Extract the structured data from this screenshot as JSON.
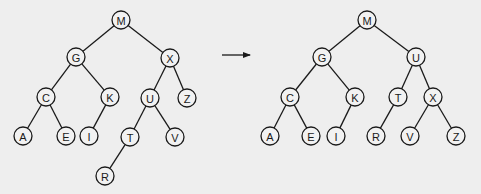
{
  "diagram": {
    "background": "#eeeeee",
    "stroke_color": "#1a1a1a",
    "node_radius": 9,
    "arrow": {
      "icon": "right-arrow-icon",
      "glyph": "→",
      "x1": 222,
      "y1": 55,
      "x2": 250,
      "y2": 55
    },
    "trees": [
      {
        "name": "before",
        "nodes": [
          {
            "id": "M",
            "label": "M",
            "x": 121,
            "y": 20
          },
          {
            "id": "G",
            "label": "G",
            "x": 76,
            "y": 57
          },
          {
            "id": "X",
            "label": "X",
            "x": 170,
            "y": 58
          },
          {
            "id": "C",
            "label": "C",
            "x": 46,
            "y": 97
          },
          {
            "id": "K",
            "label": "K",
            "x": 110,
            "y": 97
          },
          {
            "id": "U",
            "label": "U",
            "x": 150,
            "y": 98
          },
          {
            "id": "Z",
            "label": "Z",
            "x": 187,
            "y": 98
          },
          {
            "id": "A",
            "label": "A",
            "x": 23,
            "y": 136
          },
          {
            "id": "E",
            "label": "E",
            "x": 66,
            "y": 136
          },
          {
            "id": "I",
            "label": "I",
            "x": 89,
            "y": 136
          },
          {
            "id": "T",
            "label": "T",
            "x": 130,
            "y": 137
          },
          {
            "id": "V",
            "label": "V",
            "x": 175,
            "y": 137
          },
          {
            "id": "R",
            "label": "R",
            "x": 105,
            "y": 176
          }
        ],
        "edges": [
          [
            "M",
            "G"
          ],
          [
            "M",
            "X"
          ],
          [
            "G",
            "C"
          ],
          [
            "G",
            "K"
          ],
          [
            "X",
            "U"
          ],
          [
            "X",
            "Z"
          ],
          [
            "C",
            "A"
          ],
          [
            "C",
            "E"
          ],
          [
            "K",
            "I"
          ],
          [
            "U",
            "T"
          ],
          [
            "U",
            "V"
          ],
          [
            "T",
            "R"
          ]
        ]
      },
      {
        "name": "after",
        "nodes": [
          {
            "id": "M",
            "label": "M",
            "x": 367,
            "y": 20
          },
          {
            "id": "G",
            "label": "G",
            "x": 322,
            "y": 57
          },
          {
            "id": "U",
            "label": "U",
            "x": 416,
            "y": 57
          },
          {
            "id": "C",
            "label": "C",
            "x": 290,
            "y": 97
          },
          {
            "id": "K",
            "label": "K",
            "x": 355,
            "y": 97
          },
          {
            "id": "T",
            "label": "T",
            "x": 398,
            "y": 97
          },
          {
            "id": "X",
            "label": "X",
            "x": 433,
            "y": 97
          },
          {
            "id": "A",
            "label": "A",
            "x": 270,
            "y": 136
          },
          {
            "id": "E",
            "label": "E",
            "x": 311,
            "y": 136
          },
          {
            "id": "I",
            "label": "I",
            "x": 336,
            "y": 136
          },
          {
            "id": "R",
            "label": "R",
            "x": 376,
            "y": 136
          },
          {
            "id": "V",
            "label": "V",
            "x": 410,
            "y": 136
          },
          {
            "id": "Z",
            "label": "Z",
            "x": 456,
            "y": 136
          }
        ],
        "edges": [
          [
            "M",
            "G"
          ],
          [
            "M",
            "U"
          ],
          [
            "G",
            "C"
          ],
          [
            "G",
            "K"
          ],
          [
            "U",
            "T"
          ],
          [
            "U",
            "X"
          ],
          [
            "C",
            "A"
          ],
          [
            "C",
            "E"
          ],
          [
            "K",
            "I"
          ],
          [
            "T",
            "R"
          ],
          [
            "X",
            "V"
          ],
          [
            "X",
            "Z"
          ]
        ]
      }
    ]
  }
}
